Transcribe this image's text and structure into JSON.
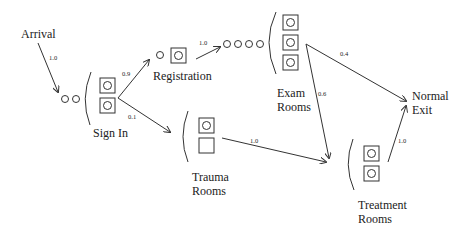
{
  "diagram": {
    "nodes": {
      "arrival": {
        "label": "Arrival"
      },
      "sign_in": {
        "label": "Sign In",
        "servers": 2,
        "queue": 2
      },
      "registration": {
        "label": "Registration",
        "servers": 1,
        "queue": 1
      },
      "exam_rooms": {
        "label_line1": "Exam",
        "label_line2": "Rooms",
        "servers": 3,
        "queue": 4
      },
      "trauma_rooms": {
        "label_line1": "Trauma",
        "label_line2": "Rooms",
        "servers": 2,
        "busy": 1
      },
      "treatment_rooms": {
        "label_line1": "Treatment",
        "label_line2": "Rooms",
        "servers": 2
      },
      "normal_exit": {
        "label_line1": "Normal",
        "label_line2": "Exit"
      }
    },
    "edges": [
      {
        "from": "arrival",
        "to": "sign_in",
        "prob": "1.0"
      },
      {
        "from": "sign_in",
        "to": "registration",
        "prob": "0.9"
      },
      {
        "from": "sign_in",
        "to": "trauma_rooms",
        "prob": "0.1"
      },
      {
        "from": "registration",
        "to": "exam_rooms",
        "prob": "1.0"
      },
      {
        "from": "exam_rooms",
        "to": "normal_exit",
        "prob": "0.4"
      },
      {
        "from": "exam_rooms",
        "to": "treatment_rooms",
        "prob": "0.6"
      },
      {
        "from": "trauma_rooms",
        "to": "treatment_rooms",
        "prob": "1.0"
      },
      {
        "from": "treatment_rooms",
        "to": "normal_exit",
        "prob": "1.0"
      }
    ]
  }
}
